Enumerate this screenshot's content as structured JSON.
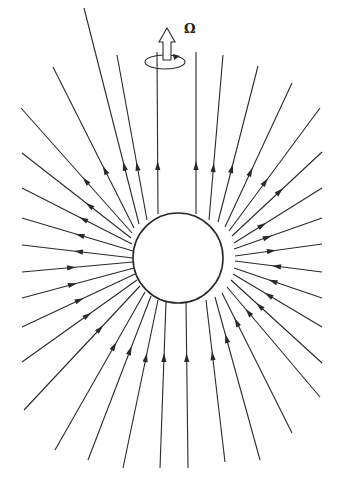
{
  "figure": {
    "width": 342,
    "height": 498,
    "background": "#ffffff",
    "stroke_color": "#2a2a2a",
    "center": {
      "x": 178,
      "y": 258
    },
    "sphere_radius": 45,
    "rotation_label": "Ω",
    "rotation_symbol": {
      "arrow_base_x": 167,
      "arrow_tip_y": 28,
      "arrow_base_y": 73,
      "ellipse": {
        "cx": 165,
        "cy": 62,
        "rx": 20,
        "ry": 7
      }
    },
    "field_lines": {
      "description": "Radial field lines; upper hemisphere arrows point outward, lower hemisphere arrows point inward",
      "lines": [
        {
          "x1": 158,
          "y1": 214,
          "x2": 157,
          "y2": 52,
          "dir": "out",
          "ax": 157,
          "ay": 165
        },
        {
          "x1": 196,
          "y1": 214,
          "x2": 196,
          "y2": 52,
          "dir": "out",
          "ax": 196,
          "ay": 165
        },
        {
          "x1": 147,
          "y1": 220,
          "x2": 117,
          "y2": 55,
          "dir": "out",
          "ax": 130,
          "ay": 167
        },
        {
          "x1": 209,
          "y1": 220,
          "x2": 223,
          "y2": 55,
          "dir": "out",
          "ax": 213,
          "ay": 167
        },
        {
          "x1": 139,
          "y1": 224,
          "x2": 84,
          "y2": 8,
          "dir": "out",
          "ax": 115,
          "ay": 168
        },
        {
          "x1": 218,
          "y1": 222,
          "x2": 258,
          "y2": 66,
          "dir": "out",
          "ax": 236,
          "ay": 169
        },
        {
          "x1": 134,
          "y1": 228,
          "x2": 53,
          "y2": 67,
          "dir": "out",
          "ax": 100,
          "ay": 172
        },
        {
          "x1": 225,
          "y1": 227,
          "x2": 292,
          "y2": 83,
          "dir": "out",
          "ax": 252,
          "ay": 172
        },
        {
          "x1": 132,
          "y1": 233,
          "x2": 21,
          "y2": 108,
          "dir": "out",
          "ax": 88,
          "ay": 178
        },
        {
          "x1": 229,
          "y1": 231,
          "x2": 320,
          "y2": 108,
          "dir": "out",
          "ax": 265,
          "ay": 181
        },
        {
          "x1": 131,
          "y1": 238,
          "x2": 22,
          "y2": 153,
          "dir": "out",
          "ax": 100,
          "ay": 191
        },
        {
          "x1": 232,
          "y1": 236,
          "x2": 322,
          "y2": 152,
          "dir": "out",
          "ax": 281,
          "ay": 192
        },
        {
          "x1": 132,
          "y1": 244,
          "x2": 22,
          "y2": 188,
          "dir": "out",
          "ax": 90,
          "ay": 205
        },
        {
          "x1": 234,
          "y1": 243,
          "x2": 322,
          "y2": 188,
          "dir": "out",
          "ax": 262,
          "ay": 224
        },
        {
          "x1": 133,
          "y1": 251,
          "x2": 22,
          "y2": 218,
          "dir": "out",
          "ax": 80,
          "ay": 233
        },
        {
          "x1": 234,
          "y1": 249,
          "x2": 322,
          "y2": 218,
          "dir": "out",
          "ax": 268,
          "ay": 237
        },
        {
          "x1": 133,
          "y1": 258,
          "x2": 22,
          "y2": 245,
          "dir": "out",
          "ax": 78,
          "ay": 251
        },
        {
          "x1": 235,
          "y1": 256,
          "x2": 322,
          "y2": 244,
          "dir": "out",
          "ax": 272,
          "ay": 251
        },
        {
          "x1": 133,
          "y1": 262,
          "x2": 22,
          "y2": 272,
          "dir": "in",
          "ax": 72,
          "ay": 267
        },
        {
          "x1": 235,
          "y1": 261,
          "x2": 322,
          "y2": 272,
          "dir": "in",
          "ax": 276,
          "ay": 266
        },
        {
          "x1": 134,
          "y1": 268,
          "x2": 22,
          "y2": 298,
          "dir": "in",
          "ax": 73,
          "ay": 284
        },
        {
          "x1": 234,
          "y1": 268,
          "x2": 322,
          "y2": 298,
          "dir": "in",
          "ax": 272,
          "ay": 282
        },
        {
          "x1": 135,
          "y1": 274,
          "x2": 22,
          "y2": 327,
          "dir": "in",
          "ax": 80,
          "ay": 300
        },
        {
          "x1": 233,
          "y1": 274,
          "x2": 322,
          "y2": 327,
          "dir": "in",
          "ax": 268,
          "ay": 295
        },
        {
          "x1": 137,
          "y1": 280,
          "x2": 22,
          "y2": 362,
          "dir": "in",
          "ax": 88,
          "ay": 315
        },
        {
          "x1": 231,
          "y1": 280,
          "x2": 322,
          "y2": 363,
          "dir": "in",
          "ax": 258,
          "ay": 307
        },
        {
          "x1": 140,
          "y1": 286,
          "x2": 24,
          "y2": 410,
          "dir": "in",
          "ax": 100,
          "ay": 328
        },
        {
          "x1": 227,
          "y1": 287,
          "x2": 320,
          "y2": 397,
          "dir": "in",
          "ax": 248,
          "ay": 312
        },
        {
          "x1": 145,
          "y1": 292,
          "x2": 55,
          "y2": 450,
          "dir": "in",
          "ax": 113,
          "ay": 345
        },
        {
          "x1": 222,
          "y1": 293,
          "x2": 292,
          "y2": 433,
          "dir": "in",
          "ax": 236,
          "ay": 322
        },
        {
          "x1": 151,
          "y1": 296,
          "x2": 88,
          "y2": 460,
          "dir": "in",
          "ax": 130,
          "ay": 350
        },
        {
          "x1": 215,
          "y1": 297,
          "x2": 260,
          "y2": 460,
          "dir": "in",
          "ax": 226,
          "ay": 338
        },
        {
          "x1": 158,
          "y1": 300,
          "x2": 123,
          "y2": 468,
          "dir": "in",
          "ax": 146,
          "ay": 357
        },
        {
          "x1": 206,
          "y1": 300,
          "x2": 225,
          "y2": 462,
          "dir": "in",
          "ax": 214,
          "ay": 355
        },
        {
          "x1": 166,
          "y1": 302,
          "x2": 160,
          "y2": 468,
          "dir": "in",
          "ax": 164,
          "ay": 357
        },
        {
          "x1": 186,
          "y1": 302,
          "x2": 188,
          "y2": 468,
          "dir": "in",
          "ax": 187,
          "ay": 357
        }
      ]
    }
  }
}
